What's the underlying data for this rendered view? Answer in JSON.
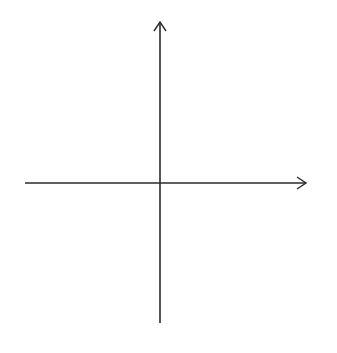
{
  "diagram": {
    "type": "coordinate-plane",
    "x_axis_label": "x",
    "y_axis_label": "y",
    "x_range": [
      -6,
      6
    ],
    "y_range": [
      -6,
      6
    ],
    "grid": true,
    "grid_style": "dotted",
    "x_tick_labels": [
      "-5",
      "-4",
      "-3",
      "-2",
      "-1",
      "1",
      "2",
      "3",
      "4",
      "5"
    ],
    "y_tick_labels": [
      "5",
      "4",
      "3",
      "2",
      "1",
      "-1",
      "-2",
      "-3",
      "-4",
      "-5"
    ]
  },
  "colors": {
    "axis": "#2a2a2a",
    "grid": "#8a8a8a",
    "background": "#ffffff"
  }
}
